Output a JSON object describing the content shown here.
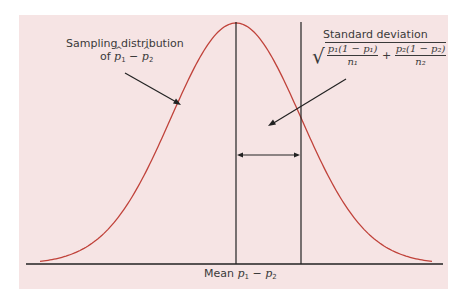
{
  "diagram": {
    "colors": {
      "background": "#f6e4e4",
      "curve": "#c0423a",
      "axis": "#222222",
      "text": "#3a3a3a"
    },
    "labels": {
      "curve_label_line1": "Sampling distribution",
      "curve_label_line2_prefix": "of ",
      "curve_label_p1": "p",
      "curve_label_sub1": "1",
      "curve_label_minus": " − ",
      "curve_label_p2": "p",
      "curve_label_sub2": "2",
      "sd_label": "Standard deviation",
      "sd_formula_num1": "p₁(1 − p₁)",
      "sd_formula_den1": "n₁",
      "sd_formula_plus": "+",
      "sd_formula_num2": "p₂(1 − p₂)",
      "sd_formula_den2": "n₂",
      "mean_prefix": "Mean ",
      "mean_p1": "p",
      "mean_sub1": "1",
      "mean_minus": " − ",
      "mean_p2": "p",
      "mean_sub2": "2"
    }
  },
  "chart_data": {
    "type": "line",
    "xlabel": "Mean p1 − p2",
    "ylabel": "",
    "series": [
      {
        "name": "Normal curve",
        "shape": "normal",
        "mean_position": "center",
        "sd_marker": "one standard deviation to the right of mean"
      }
    ],
    "annotations": [
      "Sampling distribution of p̂1 − p̂2",
      "Standard deviation √(p1(1−p1)/n1 + p2(1−p2)/n2)",
      "Mean p1 − p2"
    ],
    "grid": false
  }
}
